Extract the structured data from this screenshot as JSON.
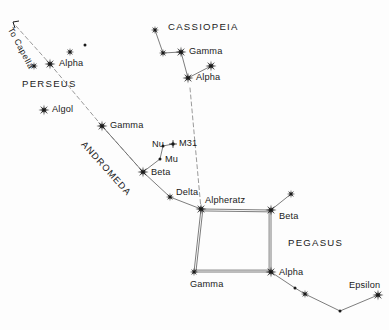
{
  "chart_data": {
    "type": "scatter",
    "xlabel": "",
    "ylabel": "",
    "xlim": [
      0,
      389
    ],
    "ylim": [
      0,
      330
    ],
    "grid": false,
    "legend": null,
    "background_color": "#ffffff",
    "ink_color": "#1a1a1a",
    "line_color": "#6e6e6e",
    "dashed_line_color": "#9a9a9a",
    "constellations": [
      {
        "name": "PERSEUS",
        "label_x": 22,
        "label_y": 79,
        "stars": [
          {
            "name": "Alpha",
            "x": 50,
            "y": 64,
            "size": "large",
            "label_x": 59,
            "label_y": 59
          },
          {
            "name": "",
            "x": 34,
            "y": 66,
            "size": "medium",
            "label_x": 0,
            "label_y": 0
          },
          {
            "name": "",
            "x": 70,
            "y": 52,
            "size": "medium",
            "label_x": 0,
            "label_y": 0
          },
          {
            "name": "",
            "x": 85,
            "y": 45,
            "size": "tiny",
            "label_x": 0,
            "label_y": 0
          },
          {
            "name": "Algol",
            "x": 44,
            "y": 110,
            "size": "large",
            "label_x": 52,
            "label_y": 105
          }
        ],
        "segments": []
      },
      {
        "name": "CASSIOPEIA",
        "label_x": 168,
        "label_y": 22,
        "stars": [
          {
            "name": "",
            "x": 155,
            "y": 30,
            "size": "medium",
            "label_x": 0,
            "label_y": 0
          },
          {
            "name": "",
            "x": 163,
            "y": 53,
            "size": "medium",
            "label_x": 0,
            "label_y": 0
          },
          {
            "name": "Gamma",
            "x": 181,
            "y": 52,
            "size": "large",
            "label_x": 189,
            "label_y": 47
          },
          {
            "name": "Alpha",
            "x": 188,
            "y": 78,
            "size": "large",
            "label_x": 196,
            "label_y": 73
          },
          {
            "name": "",
            "x": 211,
            "y": 66,
            "size": "large",
            "label_x": 0,
            "label_y": 0
          }
        ],
        "segments": [
          [
            155,
            30,
            163,
            53
          ],
          [
            163,
            53,
            181,
            52
          ],
          [
            181,
            52,
            188,
            78
          ],
          [
            188,
            78,
            211,
            66
          ]
        ]
      },
      {
        "name": "ANDROMEDA",
        "label_x": 86,
        "label_y": 140,
        "stars": [
          {
            "name": "Gamma",
            "x": 102,
            "y": 126,
            "size": "large",
            "label_x": 110,
            "label_y": 121
          },
          {
            "name": "Beta",
            "x": 143,
            "y": 172,
            "size": "large",
            "label_x": 151,
            "label_y": 168
          },
          {
            "name": "Delta",
            "x": 170,
            "y": 197,
            "size": "medium",
            "label_x": 176,
            "label_y": 188
          },
          {
            "name": "Nu",
            "x": 163,
            "y": 146,
            "size": "tiny",
            "label_x": 152,
            "label_y": 140
          },
          {
            "name": "Mu",
            "x": 160,
            "y": 159,
            "size": "tiny",
            "label_x": 165,
            "label_y": 155
          },
          {
            "name": "M31",
            "x": 173,
            "y": 144,
            "size": "nebula",
            "label_x": 179,
            "label_y": 139
          }
        ],
        "segments": [
          [
            102,
            126,
            143,
            172
          ],
          [
            143,
            172,
            170,
            197
          ],
          [
            170,
            197,
            201,
            209
          ],
          [
            143,
            172,
            160,
            159
          ],
          [
            160,
            159,
            163,
            146
          ],
          [
            163,
            146,
            173,
            144
          ]
        ]
      },
      {
        "name": "PEGASUS",
        "label_x": 288,
        "label_y": 238,
        "stars": [
          {
            "name": "Alpheratz",
            "x": 201,
            "y": 209,
            "size": "large",
            "label_x": 205,
            "label_y": 196
          },
          {
            "name": "Beta",
            "x": 271,
            "y": 210,
            "size": "large",
            "label_x": 279,
            "label_y": 212
          },
          {
            "name": "Gamma",
            "x": 194,
            "y": 272,
            "size": "medium",
            "label_x": 190,
            "label_y": 280
          },
          {
            "name": "Alpha",
            "x": 271,
            "y": 272,
            "size": "large",
            "label_x": 279,
            "label_y": 268
          },
          {
            "name": "Epsilon",
            "x": 378,
            "y": 295,
            "size": "large",
            "label_x": 349,
            "label_y": 281
          },
          {
            "name": "",
            "x": 291,
            "y": 194,
            "size": "medium",
            "label_x": 0,
            "label_y": 0
          },
          {
            "name": "",
            "x": 295,
            "y": 288,
            "size": "tiny",
            "label_x": 0,
            "label_y": 0
          },
          {
            "name": "",
            "x": 305,
            "y": 294,
            "size": "medium",
            "label_x": 0,
            "label_y": 0
          },
          {
            "name": "",
            "x": 340,
            "y": 311,
            "size": "tiny",
            "label_x": 0,
            "label_y": 0
          }
        ],
        "segments": [
          [
            271,
            210,
            291,
            194
          ],
          [
            271,
            272,
            295,
            288
          ],
          [
            295,
            288,
            305,
            294
          ],
          [
            305,
            294,
            340,
            311
          ],
          [
            340,
            311,
            378,
            295
          ]
        ],
        "square": [
          [
            201,
            209,
            271,
            210
          ],
          [
            271,
            210,
            271,
            272
          ],
          [
            271,
            272,
            194,
            272
          ],
          [
            194,
            272,
            201,
            209
          ]
        ]
      }
    ],
    "pointer_lines": [
      {
        "name": "to-capella-line",
        "label": "To Capella",
        "label_x": 14,
        "label_y": 26,
        "arrow_x": 13,
        "arrow_y": 22,
        "path": [
          [
            16,
            26
          ],
          [
            50,
            64
          ],
          [
            102,
            126
          ],
          [
            143,
            172
          ]
        ]
      },
      {
        "name": "cassiopeia-to-alpheratz-line",
        "label": "",
        "label_x": 0,
        "label_y": 0,
        "arrow_x": 0,
        "arrow_y": 0,
        "path": [
          [
            190,
            88
          ],
          [
            201,
            209
          ]
        ]
      }
    ]
  }
}
